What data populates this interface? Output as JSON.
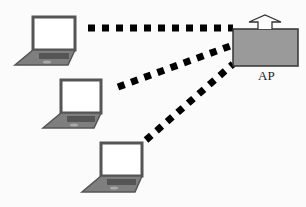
{
  "diagram": {
    "title": "",
    "access_point": {
      "label": "AP",
      "fill": "#9a9a9a",
      "stroke": "#333333"
    },
    "clients": [
      {
        "name": "laptop-1",
        "type": "laptop"
      },
      {
        "name": "laptop-2",
        "type": "laptop"
      },
      {
        "name": "laptop-3",
        "type": "laptop"
      }
    ],
    "links": [
      {
        "from": "laptop-1",
        "to": "AP",
        "style": "dotted"
      },
      {
        "from": "laptop-2",
        "to": "AP",
        "style": "dotted"
      },
      {
        "from": "laptop-3",
        "to": "AP",
        "style": "dotted"
      }
    ],
    "colors": {
      "laptop_body": "#8a8a8a",
      "laptop_screen": "#ffffff",
      "link": "#000000"
    }
  }
}
